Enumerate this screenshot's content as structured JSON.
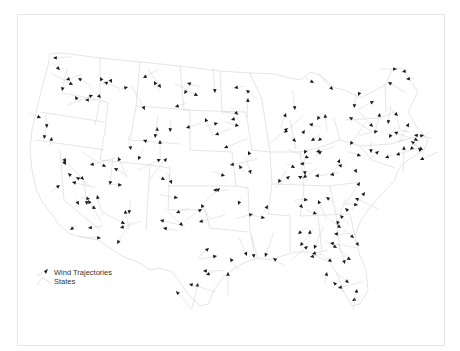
{
  "map": {
    "title": "",
    "colors": {
      "state_outline": "#d4d4d4",
      "trajectory_line": "#d0d0d0",
      "arrow": "#1a1a1a",
      "frame": "#e6e6e6",
      "background": "#ffffff"
    },
    "legend": {
      "items": [
        {
          "label": "Wind Trajectories",
          "symbol": "arrow-icon"
        },
        {
          "label": "States",
          "symbol": "polygon-icon"
        }
      ]
    }
  },
  "trajectories": [
    [
      53,
      58,
      0
    ],
    [
      60,
      70,
      0
    ],
    [
      66,
      80,
      0
    ],
    [
      73,
      85,
      0
    ],
    [
      78,
      78,
      0
    ],
    [
      62,
      91,
      0
    ],
    [
      75,
      96,
      0
    ],
    [
      85,
      100,
      0
    ],
    [
      100,
      77,
      0
    ],
    [
      104,
      82,
      0
    ],
    [
      112,
      83,
      0
    ],
    [
      93,
      95,
      0
    ],
    [
      101,
      98,
      0
    ],
    [
      128,
      87,
      0
    ],
    [
      143,
      78,
      0
    ],
    [
      154,
      81,
      0
    ],
    [
      145,
      110,
      0
    ],
    [
      175,
      107,
      0
    ],
    [
      187,
      83,
      0
    ],
    [
      161,
      88,
      0
    ],
    [
      184,
      94,
      0
    ],
    [
      198,
      96,
      0
    ],
    [
      215,
      93,
      0
    ],
    [
      234,
      88,
      0
    ],
    [
      246,
      90,
      0
    ],
    [
      248,
      98,
      0
    ],
    [
      238,
      115,
      0
    ],
    [
      231,
      120,
      0
    ],
    [
      239,
      126,
      0
    ],
    [
      205,
      118,
      0
    ],
    [
      218,
      123,
      0
    ],
    [
      215,
      135,
      0
    ],
    [
      224,
      148,
      0
    ],
    [
      186,
      128,
      0
    ],
    [
      170,
      132,
      0
    ],
    [
      157,
      127,
      0
    ],
    [
      155,
      138,
      0
    ],
    [
      167,
      158,
      0
    ],
    [
      161,
      159,
      0
    ],
    [
      160,
      140,
      0
    ],
    [
      143,
      140,
      0
    ],
    [
      138,
      160,
      0
    ],
    [
      131,
      150,
      0
    ],
    [
      118,
      157,
      0
    ],
    [
      110,
      185,
      0
    ],
    [
      122,
      185,
      0
    ],
    [
      114,
      168,
      0
    ],
    [
      106,
      167,
      0
    ],
    [
      90,
      165,
      0
    ],
    [
      76,
      177,
      0
    ],
    [
      84,
      180,
      0
    ],
    [
      60,
      185,
      0
    ],
    [
      90,
      199,
      0
    ],
    [
      97,
      195,
      0
    ],
    [
      88,
      200,
      0
    ],
    [
      87,
      205,
      0
    ],
    [
      79,
      205,
      0
    ],
    [
      96,
      209,
      0
    ],
    [
      72,
      182,
      0
    ],
    [
      66,
      160,
      0
    ],
    [
      62,
      160,
      0
    ],
    [
      44,
      139,
      0
    ],
    [
      41,
      118,
      0
    ],
    [
      47,
      128,
      0
    ],
    [
      52,
      137,
      0
    ],
    [
      66,
      165,
      0
    ],
    [
      68,
      173,
      0
    ],
    [
      70,
      230,
      0
    ],
    [
      88,
      228,
      0
    ],
    [
      101,
      238,
      0
    ],
    [
      120,
      228,
      0
    ],
    [
      117,
      244,
      0
    ],
    [
      125,
      210,
      0
    ],
    [
      129,
      214,
      0
    ],
    [
      125,
      224,
      0
    ],
    [
      165,
      180,
      0
    ],
    [
      172,
      184,
      0
    ],
    [
      178,
      198,
      0
    ],
    [
      176,
      213,
      0
    ],
    [
      160,
      220,
      0
    ],
    [
      163,
      228,
      0
    ],
    [
      183,
      226,
      0
    ],
    [
      201,
      204,
      0
    ],
    [
      202,
      209,
      0
    ],
    [
      199,
      222,
      0
    ],
    [
      209,
      248,
      0
    ],
    [
      203,
      271,
      0
    ],
    [
      198,
      283,
      0
    ],
    [
      189,
      284,
      0
    ],
    [
      176,
      291,
      0
    ],
    [
      206,
      275,
      0
    ],
    [
      217,
      256,
      0
    ],
    [
      230,
      258,
      0
    ],
    [
      228,
      272,
      0
    ],
    [
      213,
      190,
      0
    ],
    [
      220,
      188,
      0
    ],
    [
      225,
      176,
      0
    ],
    [
      230,
      165,
      0
    ],
    [
      239,
      165,
      0
    ],
    [
      248,
      151,
      0
    ],
    [
      251,
      174,
      0
    ],
    [
      238,
      205,
      0
    ],
    [
      253,
      214,
      0
    ],
    [
      265,
      218,
      0
    ],
    [
      247,
      256,
      0
    ],
    [
      254,
      258,
      0
    ],
    [
      265,
      257,
      0
    ],
    [
      273,
      258,
      0
    ],
    [
      268,
      205,
      0
    ],
    [
      278,
      183,
      0
    ],
    [
      290,
      176,
      0
    ],
    [
      295,
      168,
      0
    ],
    [
      300,
      164,
      0
    ],
    [
      303,
      178,
      0
    ],
    [
      304,
      154,
      0
    ],
    [
      309,
      158,
      0
    ],
    [
      316,
      152,
      0
    ],
    [
      322,
      151,
      0
    ],
    [
      311,
      141,
      0
    ],
    [
      318,
      141,
      0
    ],
    [
      296,
      142,
      0
    ],
    [
      305,
      130,
      0
    ],
    [
      309,
      124,
      0
    ],
    [
      317,
      120,
      0
    ],
    [
      325,
      114,
      0
    ],
    [
      295,
      110,
      0
    ],
    [
      288,
      128,
      0
    ],
    [
      284,
      133,
      0
    ],
    [
      286,
      113,
      0
    ],
    [
      314,
      83,
      0
    ],
    [
      333,
      90,
      0
    ],
    [
      349,
      117,
      0
    ],
    [
      354,
      108,
      0
    ],
    [
      358,
      96,
      0
    ],
    [
      374,
      101,
      0
    ],
    [
      380,
      113,
      0
    ],
    [
      388,
      124,
      0
    ],
    [
      373,
      127,
      0
    ],
    [
      378,
      131,
      0
    ],
    [
      389,
      138,
      0
    ],
    [
      394,
      132,
      0
    ],
    [
      398,
      116,
      0
    ],
    [
      409,
      123,
      0
    ],
    [
      414,
      135,
      0
    ],
    [
      411,
      141,
      0
    ],
    [
      418,
      141,
      0
    ],
    [
      410,
      150,
      0
    ],
    [
      404,
      146,
      0
    ],
    [
      396,
      155,
      0
    ],
    [
      385,
      158,
      0
    ],
    [
      379,
      151,
      0
    ],
    [
      371,
      153,
      0
    ],
    [
      361,
      156,
      0
    ],
    [
      350,
      145,
      0
    ],
    [
      340,
      159,
      0
    ],
    [
      338,
      165,
      0
    ],
    [
      330,
      175,
      0
    ],
    [
      315,
      176,
      0
    ],
    [
      305,
      175,
      0
    ],
    [
      298,
      176,
      0
    ],
    [
      388,
      82,
      0
    ],
    [
      406,
      79,
      0
    ],
    [
      397,
      69,
      0
    ],
    [
      402,
      72,
      0
    ],
    [
      418,
      148,
      0
    ],
    [
      423,
      150,
      0
    ],
    [
      420,
      160,
      0
    ],
    [
      424,
      135,
      0
    ],
    [
      357,
      173,
      0
    ],
    [
      360,
      182,
      0
    ],
    [
      365,
      192,
      0
    ],
    [
      355,
      198,
      0
    ],
    [
      358,
      205,
      0
    ],
    [
      345,
      208,
      0
    ],
    [
      340,
      215,
      0
    ],
    [
      337,
      225,
      0
    ],
    [
      326,
      197,
      0
    ],
    [
      318,
      200,
      0
    ],
    [
      308,
      200,
      0
    ],
    [
      303,
      208,
      0
    ],
    [
      317,
      214,
      0
    ],
    [
      334,
      234,
      0
    ],
    [
      330,
      243,
      0
    ],
    [
      337,
      248,
      0
    ],
    [
      351,
      260,
      0
    ],
    [
      359,
      246,
      0
    ],
    [
      354,
      238,
      0
    ],
    [
      341,
      228,
      0
    ],
    [
      314,
      249,
      0
    ],
    [
      312,
      254,
      0
    ],
    [
      308,
      246,
      0
    ],
    [
      300,
      246,
      0
    ],
    [
      310,
      257,
      0
    ],
    [
      327,
      272,
      0
    ],
    [
      333,
      282,
      0
    ],
    [
      338,
      288,
      0
    ],
    [
      349,
      283,
      0
    ],
    [
      352,
      301,
      0
    ],
    [
      357,
      289,
      0
    ],
    [
      345,
      264,
      0
    ],
    [
      332,
      262,
      0
    ],
    [
      310,
      230,
      0
    ],
    [
      298,
      234,
      0
    ]
  ]
}
